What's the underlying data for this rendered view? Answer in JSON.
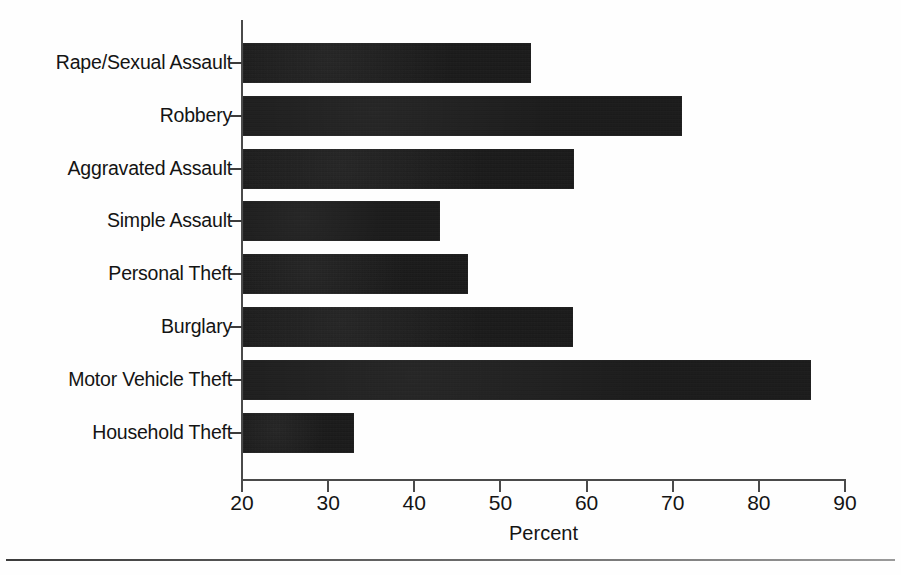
{
  "chart_data": {
    "type": "bar",
    "orientation": "horizontal",
    "title": "",
    "xlabel": "Percent",
    "ylabel": "",
    "xlim": [
      20,
      90
    ],
    "xticks": [
      20,
      30,
      40,
      50,
      60,
      70,
      80,
      90
    ],
    "grid": false,
    "legend": null,
    "bar_color": "#151515",
    "categories": [
      "Rape/Sexual Assault",
      "Robbery",
      "Aggravated Assault",
      "Simple Assault",
      "Personal Theft",
      "Burglary",
      "Motor Vehicle Theft",
      "Household Theft"
    ],
    "values": [
      53.5,
      71.1,
      58.5,
      43.0,
      46.2,
      58.4,
      86.1,
      33.0
    ]
  },
  "axis": {
    "x_title": "Percent",
    "tick_labels": [
      "20",
      "30",
      "40",
      "50",
      "60",
      "70",
      "80",
      "90"
    ]
  }
}
